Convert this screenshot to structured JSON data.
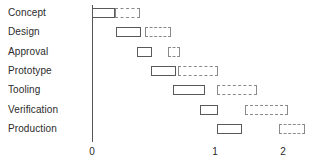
{
  "chart_data": {
    "type": "bar",
    "chart_subtype": "gantt",
    "title": "",
    "xlabel": "",
    "ylabel": "",
    "grid": false,
    "legend": null,
    "xlim": [
      0,
      2.3
    ],
    "x_ticks": [
      {
        "label": "0",
        "value": 0,
        "px": 92
      },
      {
        "label": "1",
        "value": 1,
        "px": 215
      },
      {
        "label": "2",
        "value": 2,
        "px": 283
      }
    ],
    "categories": [
      "Concept",
      "Design",
      "Approval",
      "Prototype",
      "Tooling",
      "Verification",
      "Production"
    ],
    "series": [
      {
        "name": "actual",
        "style": "solid",
        "bars": [
          {
            "category": "Concept",
            "start_px": 92,
            "end_px": 115
          },
          {
            "category": "Design",
            "start_px": 116,
            "end_px": 141
          },
          {
            "category": "Approval",
            "start_px": 137,
            "end_px": 152
          },
          {
            "category": "Prototype",
            "start_px": 151,
            "end_px": 176
          },
          {
            "category": "Tooling",
            "start_px": 173,
            "end_px": 205
          },
          {
            "category": "Verification",
            "start_px": 200,
            "end_px": 218
          },
          {
            "category": "Production",
            "start_px": 217,
            "end_px": 242
          }
        ]
      },
      {
        "name": "planned",
        "style": "dashed",
        "bars": [
          {
            "category": "Concept",
            "start_px": 115,
            "end_px": 140
          },
          {
            "category": "Design",
            "start_px": 145,
            "end_px": 171
          },
          {
            "category": "Approval",
            "start_px": 168,
            "end_px": 180
          },
          {
            "category": "Prototype",
            "start_px": 178,
            "end_px": 218
          },
          {
            "category": "Tooling",
            "start_px": 217,
            "end_px": 257
          },
          {
            "category": "Verification",
            "start_px": 245,
            "end_px": 288
          },
          {
            "category": "Production",
            "start_px": 279,
            "end_px": 305
          }
        ]
      }
    ],
    "row_geometry": {
      "first_row_center_y": 13,
      "row_spacing": 19.3,
      "bar_height": 10
    },
    "axis_geometry": {
      "axis_x_px": 92,
      "axis_top_y": 5,
      "axis_bottom_y": 142,
      "tick_label_y": 146
    },
    "colors": {
      "actual_stroke": "#595959",
      "planned_stroke": "#8a8a8a",
      "axis": "#555555",
      "text": "#2b2b2b",
      "background": "#ffffff"
    }
  }
}
